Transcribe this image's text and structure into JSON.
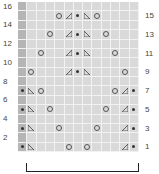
{
  "chart": {
    "columns": 13,
    "rows": 16,
    "edge_column_color": "#b5b5b5",
    "background_color": "#d9d9d9",
    "left_labels": [
      {
        "row": 16,
        "text": "16"
      },
      {
        "row": 14,
        "text": "14"
      },
      {
        "row": 12,
        "text": "12"
      },
      {
        "row": 10,
        "text": "10"
      },
      {
        "row": 8,
        "text": "8"
      },
      {
        "row": 6,
        "text": "6"
      },
      {
        "row": 4,
        "text": "4"
      },
      {
        "row": 2,
        "text": "2"
      }
    ],
    "right_labels": [
      {
        "row": 15,
        "text": "15"
      },
      {
        "row": 13,
        "text": "13"
      },
      {
        "row": 11,
        "text": "11"
      },
      {
        "row": 9,
        "text": "9"
      },
      {
        "row": 7,
        "text": "7"
      },
      {
        "row": 5,
        "text": "5"
      },
      {
        "row": 3,
        "text": "3"
      },
      {
        "row": 1,
        "text": "1"
      }
    ],
    "symbols": {
      "15": {
        "5": "circle",
        "6": "tri-left",
        "7": "dot",
        "8": "tri-right",
        "9": "circle"
      },
      "13": {
        "4": "circle",
        "6": "tri-left",
        "7": "dot",
        "8": "tri-right",
        "10": "circle"
      },
      "11": {
        "3": "circle",
        "6": "tri-left",
        "7": "dot",
        "8": "tri-right",
        "11": "circle"
      },
      "9": {
        "2": "circle",
        "6": "tri-left",
        "7": "dot",
        "8": "tri-right",
        "12": "circle"
      },
      "7": {
        "1": "dot",
        "2": "tri-right",
        "3": "circle",
        "11": "circle",
        "12": "tri-left",
        "13": "dot"
      },
      "5": {
        "1": "dot",
        "2": "tri-right",
        "4": "circle",
        "10": "circle",
        "12": "tri-left",
        "13": "dot"
      },
      "3": {
        "1": "dot",
        "2": "tri-right",
        "5": "circle",
        "9": "circle",
        "12": "tri-left",
        "13": "dot"
      },
      "1": {
        "1": "dot",
        "2": "tri-right",
        "6": "circle",
        "8": "circle",
        "12": "tri-left",
        "13": "dot"
      }
    },
    "legend": {
      "circle": "yarn over",
      "tri-left": "k2tog",
      "tri-right": "ssk",
      "dot": "purl"
    },
    "repeat_bracket": {
      "from_col": 2,
      "to_col": 13
    }
  }
}
